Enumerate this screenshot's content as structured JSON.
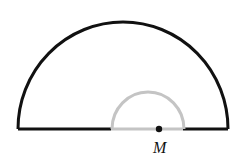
{
  "diagram": {
    "type": "semicircle-figure",
    "large_semicircle": {
      "cx": 122,
      "cy": 129,
      "r": 105,
      "stroke": "#111111",
      "stroke_width": 3
    },
    "small_semicircle": {
      "cx": 147,
      "cy": 129,
      "r": 36,
      "stroke": "#bdbdbd",
      "stroke_width": 3
    },
    "base_segments": [
      {
        "x1": 18,
        "x2": 111,
        "stroke": "#111111"
      },
      {
        "x1": 111,
        "x2": 183,
        "stroke": "#bdbdbd"
      },
      {
        "x1": 183,
        "x2": 228,
        "stroke": "#111111"
      }
    ],
    "point": {
      "x": 159,
      "y": 129,
      "label": "M"
    }
  }
}
